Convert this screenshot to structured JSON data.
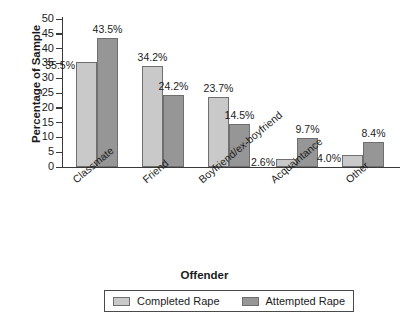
{
  "chart_data": {
    "type": "bar",
    "title": "",
    "xlabel": "Offender",
    "ylabel": "Percentage of Sample",
    "categories": [
      "Classmate",
      "Friend",
      "Boyfriend/ex-boyfriend",
      "Acquaintance",
      "Other"
    ],
    "series": [
      {
        "name": "Completed Rape",
        "color": "#c9c9c9",
        "values": [
          35.5,
          34.2,
          23.7,
          2.6,
          4.0
        ],
        "value_labels": [
          "35.5%",
          "34.2%",
          "23.7%",
          "2.6%",
          "4.0%"
        ]
      },
      {
        "name": "Attempted Rape",
        "color": "#969696",
        "values": [
          43.5,
          24.2,
          14.5,
          9.7,
          8.4
        ],
        "value_labels": [
          "43.5%",
          "24.2%",
          "14.5%",
          "9.7%",
          "8.4%"
        ]
      }
    ],
    "ylim": [
      0,
      50
    ],
    "ytick_step": 5,
    "yticks": [
      "50",
      "45",
      "40",
      "35",
      "30",
      "25",
      "20",
      "15",
      "10",
      "5",
      "0"
    ],
    "grid": false,
    "legend_position": "bottom"
  },
  "axes": {
    "y_title": "Percentage of Sample",
    "x_title": "Offender"
  },
  "legend": {
    "items": [
      {
        "label": "Completed Rape",
        "swatch": "light-gray-swatch"
      },
      {
        "label": "Attempted Rape",
        "swatch": "dark-gray-swatch"
      }
    ]
  },
  "colors": {
    "completed": "#c9c9c9",
    "attempted": "#969696",
    "axis": "#3a3a3a",
    "bar_border": "#6f6f6f",
    "background": "#ffffff"
  }
}
